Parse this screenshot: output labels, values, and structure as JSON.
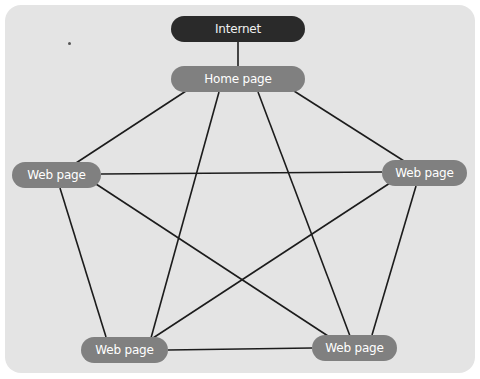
{
  "diagram": {
    "type": "network-topology",
    "title": "",
    "nodes": [
      {
        "id": "internet",
        "label": "Internet",
        "style": "dark"
      },
      {
        "id": "home",
        "label": "Home page",
        "style": "gray"
      },
      {
        "id": "left",
        "label": "Web page",
        "style": "gray"
      },
      {
        "id": "right",
        "label": "Web page",
        "style": "gray"
      },
      {
        "id": "bottom_left",
        "label": "Web page",
        "style": "gray"
      },
      {
        "id": "bottom_right",
        "label": "Web page",
        "style": "gray"
      }
    ],
    "edges": [
      [
        "internet",
        "home"
      ],
      [
        "home",
        "left"
      ],
      [
        "home",
        "bottom_left"
      ],
      [
        "home",
        "bottom_right"
      ],
      [
        "home",
        "right"
      ],
      [
        "left",
        "right"
      ],
      [
        "left",
        "bottom_left"
      ],
      [
        "left",
        "bottom_right"
      ],
      [
        "right",
        "bottom_left"
      ],
      [
        "right",
        "bottom_right"
      ],
      [
        "bottom_left",
        "bottom_right"
      ]
    ],
    "colors": {
      "panel": "#e4e4e4",
      "node_gray": "#808080",
      "node_dark": "#2a2a2a",
      "edge": "#1c1c1c",
      "label": "#ffffff"
    }
  }
}
